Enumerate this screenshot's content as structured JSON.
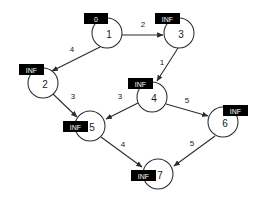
{
  "diagram": {
    "background_color": "#ffffff",
    "node_stroke_color": "#2b2b2b",
    "label_box_color": "#000000",
    "label_text_color": "#ffffff"
  },
  "nodes": [
    {
      "id": "1",
      "dist": "0",
      "cx": 107,
      "cy": 33,
      "r": 15,
      "box_x": 84,
      "box_y": 13,
      "box_w": 24,
      "box_h": 11
    },
    {
      "id": "3",
      "dist": "INF",
      "cx": 179,
      "cy": 33,
      "r": 15,
      "box_x": 155,
      "box_y": 13,
      "box_w": 25,
      "box_h": 11
    },
    {
      "id": "2",
      "dist": "INF",
      "cx": 43,
      "cy": 83,
      "r": 15,
      "box_x": 19,
      "box_y": 64,
      "box_w": 25,
      "box_h": 11
    },
    {
      "id": "4",
      "dist": "INF",
      "cx": 152,
      "cy": 97,
      "r": 15,
      "box_x": 128,
      "box_y": 78,
      "box_w": 25,
      "box_h": 11
    },
    {
      "id": "5",
      "dist": "INF",
      "cx": 90,
      "cy": 126,
      "r": 15,
      "box_x": 63,
      "box_y": 121,
      "box_w": 25,
      "box_h": 11
    },
    {
      "id": "6",
      "dist": "INF",
      "cx": 223,
      "cy": 122,
      "r": 15,
      "box_x": 223,
      "box_y": 105,
      "box_w": 25,
      "box_h": 11
    },
    {
      "id": "7",
      "dist": "INF",
      "cx": 158,
      "cy": 174,
      "r": 15,
      "box_x": 131,
      "box_y": 170,
      "box_w": 25,
      "box_h": 11
    }
  ],
  "edges": [
    {
      "from": "1",
      "to": "3",
      "weight": "2",
      "x1": 122,
      "y1": 35,
      "x2": 163,
      "y2": 35,
      "lx": 143,
      "ly": 24
    },
    {
      "from": "1",
      "to": "2",
      "weight": "4",
      "x1": 100,
      "y1": 47,
      "x2": 52,
      "y2": 71,
      "lx": 72,
      "ly": 49
    },
    {
      "from": "3",
      "to": "4",
      "weight": "1",
      "x1": 178,
      "y1": 48,
      "x2": 157,
      "y2": 81,
      "lx": 162,
      "ly": 62
    },
    {
      "from": "2",
      "to": "5",
      "weight": "3",
      "x1": 53,
      "y1": 94,
      "x2": 77,
      "y2": 117,
      "lx": 73,
      "ly": 96
    },
    {
      "from": "4",
      "to": "5",
      "weight": "3",
      "x1": 138,
      "y1": 103,
      "x2": 106,
      "y2": 119,
      "lx": 120,
      "ly": 96
    },
    {
      "from": "4",
      "to": "6",
      "weight": "5",
      "x1": 166,
      "y1": 104,
      "x2": 208,
      "y2": 116,
      "lx": 187,
      "ly": 100
    },
    {
      "from": "5",
      "to": "7",
      "weight": "4",
      "x1": 101,
      "y1": 137,
      "x2": 142,
      "y2": 167,
      "lx": 123,
      "ly": 144
    },
    {
      "from": "6",
      "to": "7",
      "weight": "5",
      "x1": 215,
      "y1": 136,
      "x2": 174,
      "y2": 166,
      "lx": 192,
      "ly": 143
    }
  ]
}
